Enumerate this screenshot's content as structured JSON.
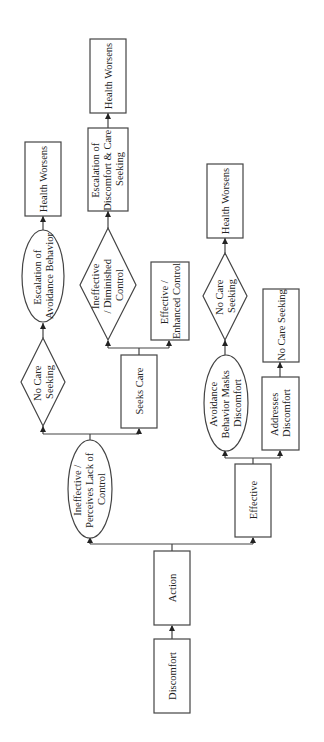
{
  "diagram": {
    "orientation": "rotated -90deg (reads bottom to top)",
    "colors": {
      "stroke": "#444444",
      "text": "#222222",
      "background": "#ffffff"
    },
    "nodes": {
      "discomfort": {
        "shape": "rect",
        "lines": [
          "Discomfort"
        ]
      },
      "action": {
        "shape": "rect",
        "lines": [
          "Action"
        ]
      },
      "ineffective_perceives": {
        "shape": "ellipse",
        "lines": [
          "Ineffective /",
          "Perceives Lack of",
          "Control"
        ]
      },
      "effective": {
        "shape": "rect",
        "lines": [
          "Effective"
        ]
      },
      "no_care_seeking_left": {
        "shape": "diamond",
        "lines": [
          "No Care",
          "Seeking"
        ]
      },
      "seeks_care": {
        "shape": "rect",
        "lines": [
          "Seeks Care"
        ]
      },
      "escalation_avoidance": {
        "shape": "ellipse",
        "lines": [
          "Escalation of",
          "Avoidance Behavior"
        ]
      },
      "health_worsens_left": {
        "shape": "rect",
        "lines": [
          "Health Worsens"
        ]
      },
      "ineffective_diminished": {
        "shape": "diamond",
        "lines": [
          "Ineffective",
          "/ Diminished",
          "Control"
        ]
      },
      "effective_enhanced": {
        "shape": "rect",
        "lines": [
          "Effective /",
          "Enhanced Control"
        ]
      },
      "escalation_discomfort": {
        "shape": "rect",
        "lines": [
          "Escalation of",
          "Discomfort & Care",
          "Seeking"
        ]
      },
      "health_worsens_middle": {
        "shape": "rect",
        "lines": [
          "Health Worsens"
        ]
      },
      "avoidance_masks": {
        "shape": "ellipse",
        "lines": [
          "Avoidance",
          "Behavior Masks",
          "Discomfort"
        ]
      },
      "addresses_discomfort": {
        "shape": "rect",
        "lines": [
          "Addresses",
          "Discomfort"
        ]
      },
      "no_care_seeking_right": {
        "shape": "diamond",
        "lines": [
          "No Care",
          "Seeking"
        ]
      },
      "no_care_seeking_box": {
        "shape": "rect",
        "lines": [
          "No Care Seeking"
        ]
      },
      "health_worsens_right": {
        "shape": "rect",
        "lines": [
          "Health Worsens"
        ]
      }
    },
    "edges": [
      [
        "discomfort",
        "action"
      ],
      [
        "action",
        "ineffective_perceives"
      ],
      [
        "action",
        "effective"
      ],
      [
        "ineffective_perceives",
        "no_care_seeking_left"
      ],
      [
        "ineffective_perceives",
        "seeks_care"
      ],
      [
        "no_care_seeking_left",
        "escalation_avoidance"
      ],
      [
        "escalation_avoidance",
        "health_worsens_left"
      ],
      [
        "seeks_care",
        "ineffective_diminished"
      ],
      [
        "seeks_care",
        "effective_enhanced"
      ],
      [
        "ineffective_diminished",
        "escalation_discomfort"
      ],
      [
        "escalation_discomfort",
        "health_worsens_middle"
      ],
      [
        "effective",
        "avoidance_masks"
      ],
      [
        "effective",
        "addresses_discomfort"
      ],
      [
        "avoidance_masks",
        "no_care_seeking_right"
      ],
      [
        "no_care_seeking_right",
        "health_worsens_right"
      ],
      [
        "addresses_discomfort",
        "no_care_seeking_box"
      ]
    ]
  }
}
